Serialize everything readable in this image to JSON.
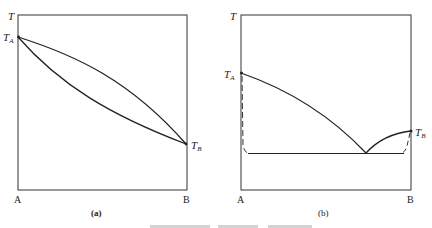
{
  "panel_a": {
    "y_axis_label": "T",
    "point_top_label": "T",
    "point_top_sub": "A",
    "point_bottom_label": "T",
    "point_bottom_sub": "B",
    "x_left_label": "A",
    "x_right_label": "B",
    "caption": "(a)"
  },
  "panel_b": {
    "y_axis_label": "T",
    "point_left_label": "T",
    "point_left_sub": "A",
    "point_right_label": "T",
    "point_right_sub": "B",
    "x_left_label": "A",
    "x_right_label": "B",
    "caption": "(b)"
  },
  "colors": {
    "line": "#222222",
    "frame": "#333333",
    "background": "#ffffff"
  }
}
